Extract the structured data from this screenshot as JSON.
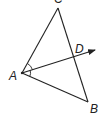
{
  "diagram": {
    "type": "geometry",
    "stroke_color": "#222222",
    "background": "#ffffff",
    "points": {
      "A": {
        "label": "A",
        "x": 22,
        "y": 73
      },
      "B": {
        "label": "B",
        "x": 88,
        "y": 102
      },
      "C": {
        "label": "C",
        "x": 58,
        "y": 8
      },
      "D": {
        "label": "D",
        "x": 73,
        "y": 57
      }
    },
    "segments": [
      [
        "A",
        "B"
      ],
      [
        "B",
        "C"
      ],
      [
        "C",
        "A"
      ]
    ],
    "rays": [
      {
        "from": "A",
        "through": "D"
      }
    ],
    "angle_marks": [
      {
        "vertex": "A",
        "between": [
          "C",
          "D"
        ],
        "arcs": 1
      },
      {
        "vertex": "A",
        "between": [
          "D",
          "B"
        ],
        "arcs": 1
      }
    ],
    "labels": {
      "A": "A",
      "B": "B",
      "C": "C",
      "D": "D"
    }
  }
}
